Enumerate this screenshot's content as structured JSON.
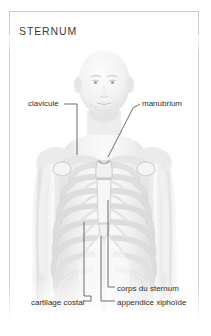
{
  "figure": {
    "title": "STERNUM",
    "border_color": "#c9c9c9",
    "background_color": "#ffffff",
    "label_color": "#2e2e2e",
    "leader_line_color": "#4a4a4a"
  },
  "labels": {
    "clavicule": "clavicule",
    "manubrium": "manubrium",
    "corps_du_sternum": "corps du sternum",
    "appendice_xiphoide": "appendice xiphoïde",
    "cartilage_costal": "cartilage costal"
  }
}
